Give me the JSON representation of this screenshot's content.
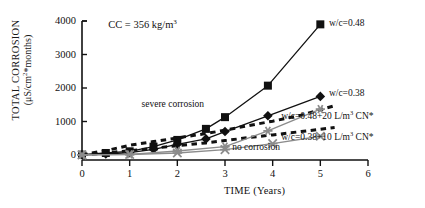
{
  "chart_data": {
    "type": "line",
    "title": "",
    "xlabel": "TIME  (Years)",
    "ylabel_line1": "TOTAL CORROSION",
    "ylabel_line2_prefix": "(μS/cm",
    "ylabel_line2_sup": "2",
    "ylabel_line2_suffix": "*months)",
    "ylabel_plain": "TOTAL CORROSION (μS/cm2*months)",
    "xlim": [
      0,
      6
    ],
    "ylim": [
      0,
      4000
    ],
    "xticks": [
      "0",
      "1",
      "2",
      "3",
      "4",
      "5",
      "6"
    ],
    "xtick_values": [
      0,
      1,
      2,
      3,
      4,
      5,
      6
    ],
    "yticks": [
      "0",
      "1000",
      "2000",
      "3000",
      "4000"
    ],
    "ytick_values": [
      0,
      1000,
      2000,
      3000,
      4000
    ],
    "grid": false,
    "legend_position": "inline-right",
    "notes": [
      {
        "id": "cc-note",
        "text_prefix": "CC = 356 kg/m",
        "text_sup": "3",
        "text": "CC = 356 kg/m3",
        "x": 0.55,
        "y": 3860
      }
    ],
    "annotations": [
      {
        "id": "severe-corrosion",
        "text": "severe corrosion",
        "x": 1.25,
        "y": 1480
      },
      {
        "id": "no-corrosion",
        "text": "no corrosion",
        "x": 3.15,
        "y": 200
      }
    ],
    "series": [
      {
        "name": "w/c=0.48",
        "label_text": "w/c=0.48",
        "label_prefix": "w/c=0.48",
        "label_sup": "",
        "label_suffix": "",
        "marker": "filled-square",
        "linestyle": "solid",
        "color": "#111111",
        "label_x": 5.18,
        "label_y": 3900,
        "x": [
          0,
          0.5,
          1,
          1.5,
          2,
          2.6,
          3,
          3.9,
          5
        ],
        "y": [
          10,
          60,
          110,
          250,
          450,
          780,
          1130,
          2070,
          3900
        ]
      },
      {
        "name": "w/c=0.38",
        "label_text": "w/c=0.38",
        "label_prefix": "w/c=0.38",
        "label_sup": "",
        "label_suffix": "",
        "marker": "filled-diamond",
        "linestyle": "solid",
        "color": "#111111",
        "label_x": 5.18,
        "label_y": 1830,
        "x": [
          0,
          0.5,
          1,
          1.5,
          2,
          2.6,
          3,
          3.9,
          5
        ],
        "y": [
          5,
          30,
          70,
          170,
          320,
          480,
          700,
          1170,
          1750
        ]
      },
      {
        "name": "w/c=0.48+20 L/m3 CN*",
        "label_text": "w/c=0.48+20 L/m3 CN*",
        "label_prefix": "w/c=0.48+20 L/m",
        "label_sup": "3",
        "label_suffix": " CN*",
        "marker": "filled-square-small",
        "linestyle": "dashed",
        "color": "#111111",
        "label_x": 4.18,
        "label_y": 1120,
        "x": [
          0,
          0.5,
          1,
          1.5,
          2,
          2.6,
          3,
          3.5,
          4,
          4.6,
          5.3
        ],
        "y": [
          10,
          130,
          290,
          400,
          510,
          640,
          740,
          880,
          1010,
          1190,
          1470
        ]
      },
      {
        "name": "w/c=0.38+10 L/m3 CN*",
        "label_text": "w/c=0.38+10 L/m3 CN*",
        "label_prefix": "w/c=0.38+10 L/m",
        "label_sup": "3",
        "label_suffix": " CN*",
        "marker": "filled-square-small",
        "linestyle": "dashed",
        "color": "#111111",
        "label_x": 4.18,
        "label_y": 510,
        "x": [
          0,
          0.5,
          1,
          1.5,
          2,
          2.6,
          3,
          3.5,
          4,
          4.6,
          5.3
        ],
        "y": [
          5,
          60,
          130,
          200,
          280,
          360,
          430,
          520,
          600,
          700,
          820
        ]
      },
      {
        "name": "gray-star-series",
        "label_text": "",
        "label_prefix": "",
        "label_sup": "",
        "label_suffix": "",
        "marker": "gray-star",
        "linestyle": "solid",
        "color": "#8c8c8c",
        "label_x": 0,
        "label_y": 0,
        "x": [
          0,
          1,
          2,
          3,
          3.9,
          5
        ],
        "y": [
          5,
          20,
          120,
          250,
          720,
          1370
        ]
      },
      {
        "name": "gray-x-series",
        "label_text": "",
        "label_prefix": "",
        "label_sup": "",
        "label_suffix": "",
        "marker": "gray-x",
        "linestyle": "solid",
        "color": "#8c8c8c",
        "label_x": 0,
        "label_y": 0,
        "x": [
          0,
          1,
          2,
          3,
          4,
          5
        ],
        "y": [
          5,
          15,
          60,
          160,
          340,
          560
        ]
      }
    ]
  }
}
